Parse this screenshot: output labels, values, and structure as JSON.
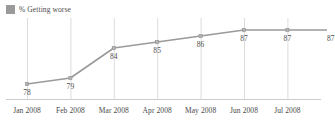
{
  "legend": {
    "items": [
      {
        "label": "% Getting worse",
        "color": "#9a9a9a",
        "swatch_name": "legend-swatch"
      }
    ],
    "position": "top-left"
  },
  "chart_data": {
    "type": "line",
    "title": "",
    "subtitle": "",
    "xlabel": "",
    "ylabel": "",
    "grid": "vertical",
    "legend_position": "top-left",
    "series_color": "#9a9a9a",
    "marker": "square",
    "categories": [
      "Jan 2008",
      "Feb 2008",
      "Mar 2008",
      "Apr 2008",
      "May 2008",
      "Jun 2008",
      "Jul 2008",
      ""
    ],
    "tick_labels": [
      "Jan 2008",
      "Feb 2008",
      "Mar 2008",
      "Apr 2008",
      "May 2008",
      "Jun 2008",
      "Jul 2008"
    ],
    "series": [
      {
        "name": "% Getting worse",
        "values": [
          78,
          79,
          84,
          85,
          86,
          87,
          87,
          87
        ]
      }
    ],
    "point_labels": [
      "78",
      "79",
      "84",
      "85",
      "86",
      "87",
      "87",
      "87"
    ],
    "ylim": [
      76,
      88
    ],
    "annotations": []
  },
  "axis": {
    "baseline_color": "#cccccc",
    "gridline_color": "#dcdcdc"
  }
}
